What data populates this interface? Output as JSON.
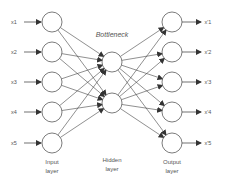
{
  "diagram": {
    "title": "Bottleneck",
    "input_labels": [
      "x1",
      "x2",
      "x3",
      "x4",
      "x5"
    ],
    "output_labels": [
      "x'1",
      "x'2",
      "x'3",
      "x'4",
      "x'5"
    ],
    "layers": {
      "input": {
        "line1": "Input",
        "line2": "layer",
        "nodes": 5
      },
      "hidden": {
        "line1": "Hidden",
        "line2": "layer",
        "nodes": 2
      },
      "output": {
        "line1": "Output",
        "line2": "layer",
        "nodes": 5
      }
    },
    "colors": {
      "stroke": "#444444",
      "node_fill": "#ffffff",
      "text": "#555555"
    }
  }
}
